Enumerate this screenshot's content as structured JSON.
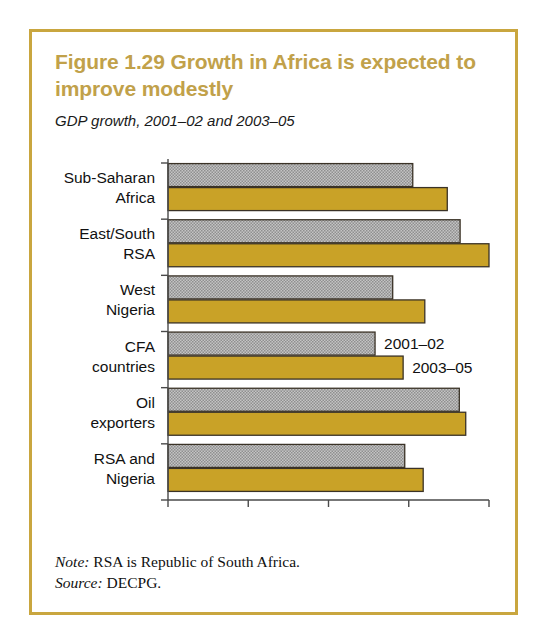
{
  "figure": {
    "title": "Figure 1.29  Growth in Africa is expected to improve modestly",
    "subtitle": "GDP growth, 2001–02 and 2003–05",
    "note_label": "Note:",
    "note_text": " RSA is Republic of South Africa.",
    "source_label": "Source:",
    "source_text": " DECPG.",
    "frame_color": "#c9a63f",
    "title_color": "#c1a14a"
  },
  "chart_data": {
    "type": "bar",
    "orientation": "horizontal",
    "title": "Figure 1.29  Growth in Africa is expected to improve modestly",
    "subtitle": "GDP growth, 2001–02 and 2003–05",
    "xlabel": "",
    "ylabel": "",
    "xlim": [
      0,
      4
    ],
    "xticks": [
      0,
      1,
      2,
      3,
      4
    ],
    "xtick_labels": [
      "0",
      "1",
      "2",
      "3",
      "4"
    ],
    "grid": false,
    "legend_position": "inside-right",
    "categories": [
      "Sub-Saharan Africa",
      "East/South RSA",
      "West Nigeria",
      "CFA countries",
      "Oil exporters",
      "RSA and Nigeria"
    ],
    "category_lines": [
      [
        "Sub-Saharan",
        "Africa"
      ],
      [
        "East/South",
        "RSA"
      ],
      [
        "West",
        "Nigeria"
      ],
      [
        "CFA",
        "countries"
      ],
      [
        "Oil",
        "exporters"
      ],
      [
        "RSA and",
        "Nigeria"
      ]
    ],
    "series": [
      {
        "name": "2001–02",
        "color": "#a8a8a8",
        "values": [
          3.05,
          3.64,
          2.8,
          2.58,
          3.63,
          2.95
        ]
      },
      {
        "name": "2003–05",
        "color": "#c9a227",
        "values": [
          3.48,
          4.0,
          3.2,
          2.93,
          3.71,
          3.18
        ]
      }
    ],
    "legend": [
      {
        "label": "2001–02",
        "color": "#a8a8a8"
      },
      {
        "label": "2003–05",
        "color": "#c9a227"
      }
    ]
  }
}
